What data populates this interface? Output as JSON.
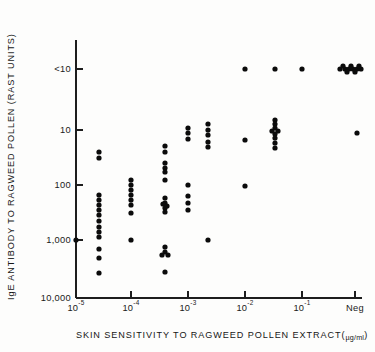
{
  "chart_data": {
    "type": "scatter",
    "title": "",
    "xlabel": "SKIN SENSITIVITY TO RAGWEED POLLEN EXTRACT(µg/ml)",
    "ylabel": "IgE ANTIBODY TO RAGWEED POLLEN (RAST UNITS)",
    "xlabel_parts": {
      "main": "SKIN SENSITIVITY TO RAGWEED POLLEN EXTRACT(",
      "units": "µg/ml",
      "close": ")"
    },
    "x_scale": "log",
    "y_scale": "log-inverted",
    "grid": false,
    "legend": "none",
    "x_tick_labels": [
      "10⁻⁵",
      "10⁻⁴",
      "10⁻³",
      "10⁻²",
      "10⁻¹",
      "Neg"
    ],
    "x_ticks": [
      {
        "label_base": "10",
        "label_exp": "-5",
        "value": 1e-05,
        "px": 76
      },
      {
        "label_base": "10",
        "label_exp": "-4",
        "value": 0.0001,
        "px": 131
      },
      {
        "label_base": "10",
        "label_exp": "-3",
        "value": 0.001,
        "px": 188
      },
      {
        "label_base": "10",
        "label_exp": "-2",
        "value": 0.01,
        "px": 245
      },
      {
        "label_base": "10",
        "label_exp": "-1",
        "value": 0.1,
        "px": 302
      },
      {
        "label_base": "Neg",
        "label_exp": "",
        "value": null,
        "px": 355
      }
    ],
    "y_tick_labels": [
      "<10",
      "10",
      "100",
      "1,000",
      "10,000"
    ],
    "y_ticks": [
      {
        "label": "<10",
        "value": 10,
        "px": 69
      },
      {
        "label": "10",
        "value": 10,
        "px": 130
      },
      {
        "label": "100",
        "value": 100,
        "px": 185
      },
      {
        "label": "1,000",
        "value": 1000,
        "px": 240
      },
      {
        "label": "10,000",
        "value": 10000,
        "px": 298
      }
    ],
    "ylim_labels": [
      "<10",
      "10,000"
    ],
    "xlim_labels": [
      "10⁻⁵",
      "Neg"
    ],
    "point_color": "#0b0b0b",
    "point_radius_px": 2.6,
    "n_points": 96,
    "points": [
      {
        "x_px": 76,
        "y_px": 240
      },
      {
        "x_px": 99,
        "y_px": 152
      },
      {
        "x_px": 99,
        "y_px": 158
      },
      {
        "x_px": 99,
        "y_px": 195
      },
      {
        "x_px": 99,
        "y_px": 200
      },
      {
        "x_px": 99,
        "y_px": 205
      },
      {
        "x_px": 99,
        "y_px": 210
      },
      {
        "x_px": 99,
        "y_px": 215
      },
      {
        "x_px": 99,
        "y_px": 221
      },
      {
        "x_px": 99,
        "y_px": 227
      },
      {
        "x_px": 99,
        "y_px": 232
      },
      {
        "x_px": 99,
        "y_px": 237
      },
      {
        "x_px": 99,
        "y_px": 249
      },
      {
        "x_px": 99,
        "y_px": 258
      },
      {
        "x_px": 99,
        "y_px": 273
      },
      {
        "x_px": 131,
        "y_px": 180
      },
      {
        "x_px": 131,
        "y_px": 185
      },
      {
        "x_px": 131,
        "y_px": 190
      },
      {
        "x_px": 131,
        "y_px": 195
      },
      {
        "x_px": 131,
        "y_px": 200
      },
      {
        "x_px": 131,
        "y_px": 205
      },
      {
        "x_px": 131,
        "y_px": 213
      },
      {
        "x_px": 131,
        "y_px": 240
      },
      {
        "x_px": 165,
        "y_px": 146
      },
      {
        "x_px": 165,
        "y_px": 152
      },
      {
        "x_px": 165,
        "y_px": 163
      },
      {
        "x_px": 165,
        "y_px": 168
      },
      {
        "x_px": 165,
        "y_px": 172
      },
      {
        "x_px": 165,
        "y_px": 180
      },
      {
        "x_px": 165,
        "y_px": 198
      },
      {
        "x_px": 165,
        "y_px": 203
      },
      {
        "x_px": 165,
        "y_px": 208
      },
      {
        "x_px": 165,
        "y_px": 212
      },
      {
        "x_px": 163,
        "y_px": 204
      },
      {
        "x_px": 167,
        "y_px": 206
      },
      {
        "x_px": 165,
        "y_px": 247
      },
      {
        "x_px": 165,
        "y_px": 252
      },
      {
        "x_px": 162,
        "y_px": 255
      },
      {
        "x_px": 168,
        "y_px": 255
      },
      {
        "x_px": 165,
        "y_px": 272
      },
      {
        "x_px": 188,
        "y_px": 128
      },
      {
        "x_px": 188,
        "y_px": 133
      },
      {
        "x_px": 188,
        "y_px": 139
      },
      {
        "x_px": 188,
        "y_px": 185
      },
      {
        "x_px": 188,
        "y_px": 196
      },
      {
        "x_px": 188,
        "y_px": 203
      },
      {
        "x_px": 188,
        "y_px": 210
      },
      {
        "x_px": 208,
        "y_px": 124
      },
      {
        "x_px": 208,
        "y_px": 130
      },
      {
        "x_px": 208,
        "y_px": 135
      },
      {
        "x_px": 208,
        "y_px": 142
      },
      {
        "x_px": 208,
        "y_px": 147
      },
      {
        "x_px": 208,
        "y_px": 240
      },
      {
        "x_px": 245,
        "y_px": 69
      },
      {
        "x_px": 245,
        "y_px": 140
      },
      {
        "x_px": 245,
        "y_px": 186
      },
      {
        "x_px": 275,
        "y_px": 69
      },
      {
        "x_px": 275,
        "y_px": 120
      },
      {
        "x_px": 275,
        "y_px": 124
      },
      {
        "x_px": 275,
        "y_px": 128
      },
      {
        "x_px": 272,
        "y_px": 131
      },
      {
        "x_px": 278,
        "y_px": 131
      },
      {
        "x_px": 275,
        "y_px": 134
      },
      {
        "x_px": 275,
        "y_px": 138
      },
      {
        "x_px": 275,
        "y_px": 143
      },
      {
        "x_px": 275,
        "y_px": 148
      },
      {
        "x_px": 302,
        "y_px": 69
      },
      {
        "x_px": 340,
        "y_px": 69
      },
      {
        "x_px": 345,
        "y_px": 69
      },
      {
        "x_px": 349,
        "y_px": 69
      },
      {
        "x_px": 353,
        "y_px": 69
      },
      {
        "x_px": 357,
        "y_px": 69
      },
      {
        "x_px": 361,
        "y_px": 69
      },
      {
        "x_px": 343,
        "y_px": 66
      },
      {
        "x_px": 351,
        "y_px": 66
      },
      {
        "x_px": 359,
        "y_px": 66
      },
      {
        "x_px": 347,
        "y_px": 72
      },
      {
        "x_px": 355,
        "y_px": 72
      },
      {
        "x_px": 357,
        "y_px": 133
      }
    ]
  }
}
